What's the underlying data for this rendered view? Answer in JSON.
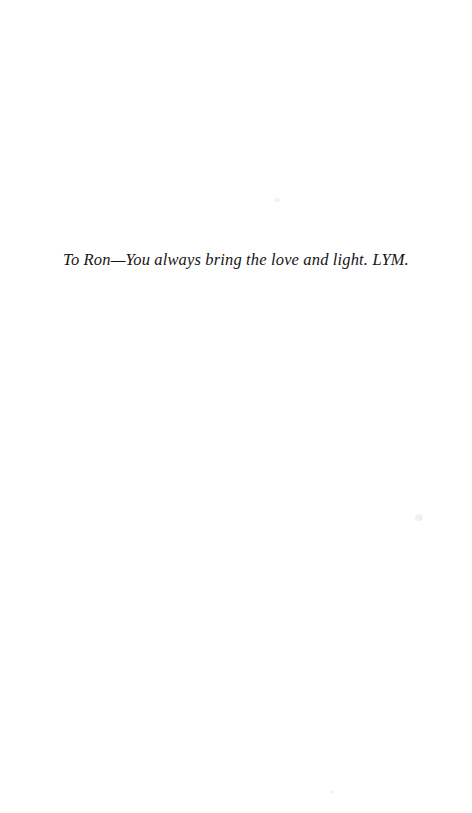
{
  "page": {
    "kind": "book-dedication-page",
    "background_color": "#ffffff",
    "ink_color": "#151515",
    "width": 472,
    "height": 813
  },
  "dedication": {
    "text": "To Ron—You always bring the love and light. LYM.",
    "style": "italic",
    "alignment": "center"
  }
}
